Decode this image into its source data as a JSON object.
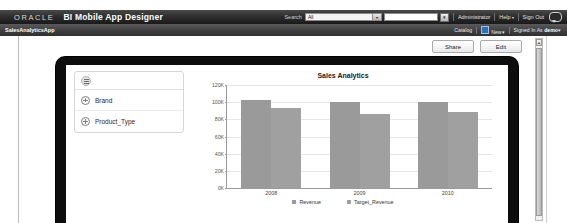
{
  "global_header": {
    "logo_text": "ORACLE",
    "app_title": "BI Mobile App Designer",
    "search_label": "Search",
    "search_scope_value": "All",
    "search_value": "",
    "search_go_icon": "search-icon",
    "links": [
      {
        "label": "Administrator",
        "caret": ""
      },
      {
        "label": "Help",
        "caret": "▾"
      },
      {
        "label": "Sign Out",
        "caret": ""
      }
    ],
    "feedback_icon": "chat-bubble-icon"
  },
  "sub_bar": {
    "breadcrumb": "SalesAnalyticsApp",
    "catalog_label": "Catalog",
    "new_label": "New",
    "new_caret": "▾",
    "signed_in_prefix": "Signed In As",
    "signed_in_user": "demo",
    "signed_in_caret": "▾"
  },
  "toolbar": {
    "share_label": "Share",
    "edit_label": "Edit"
  },
  "scrollbar": {
    "up_arrow": "▴"
  },
  "filter_panel": {
    "menu_icon": "hamburger-menu-icon",
    "items": [
      {
        "label": "Brand",
        "icon": "plus-circle-icon"
      },
      {
        "label": "Product_Type",
        "icon": "plus-circle-icon"
      }
    ]
  },
  "chart_data": {
    "type": "bar",
    "title": "Sales Analytics",
    "xlabel": "",
    "ylabel": "",
    "categories": [
      "2008",
      "2009",
      "2010"
    ],
    "series": [
      {
        "name": "Revenue",
        "values": [
          103000,
          100000,
          100000
        ],
        "color": "#9a9a9a"
      },
      {
        "name": "Target_Revenue",
        "values": [
          93000,
          86000,
          88000
        ],
        "color": "#a0a0a0"
      }
    ],
    "ylim": [
      0,
      120000
    ],
    "ytick_values": [
      0,
      20000,
      40000,
      60000,
      80000,
      100000,
      120000
    ],
    "ytick_labels": [
      "0K",
      "20K",
      "40K",
      "60K",
      "80K",
      "100K",
      "120K"
    ],
    "grid": true,
    "legend_position": "bottom"
  }
}
